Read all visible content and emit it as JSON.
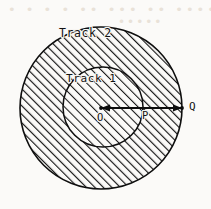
{
  "figure": {
    "title_region": "annulus-two-track-diagram",
    "background_color": "#fbfaf8",
    "ink_color": "#121212",
    "labels": {
      "outer_track": "Track 2",
      "inner_track": "Track 1",
      "center_point": "O",
      "inner_edge_point": "P",
      "outer_edge_point": "Q"
    },
    "geometry": {
      "outer_circle": {
        "cx": 101,
        "cy": 108,
        "r": 81
      },
      "inner_circle": {
        "cx": 103,
        "cy": 107,
        "r": 40
      },
      "radius_line": {
        "x1": 101,
        "y1": 108,
        "x2": 182,
        "y2": 108
      },
      "hatch_outer": {
        "direction": "forward-slash",
        "angle_deg": 45,
        "spacing_px": 4.2,
        "stroke_px": 1.7
      },
      "hatch_inner": {
        "direction": "forward-slash",
        "angle_deg": 45,
        "spacing_px": 4.6,
        "stroke_px": 1.6
      }
    },
    "scan_artifacts": {
      "bleed_text_row1": "• • • •  •• ••• •• ••••  ••",
      "bleed_text_row2": "•••••"
    }
  }
}
